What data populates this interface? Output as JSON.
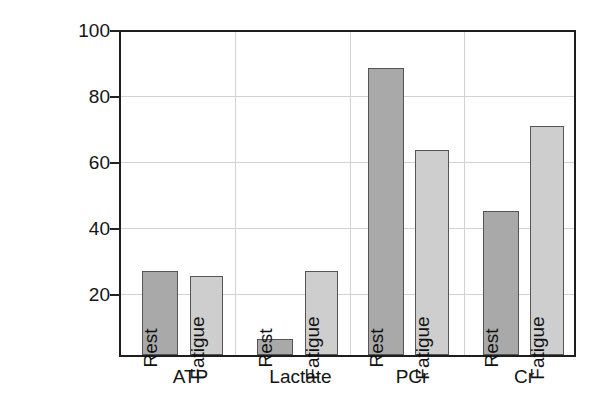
{
  "chart_data": {
    "type": "bar",
    "title": "",
    "xlabel": "",
    "ylabel": "mmoles/kg dry weight",
    "ylim": [
      0,
      100
    ],
    "yticks": [
      20,
      40,
      60,
      80,
      100
    ],
    "ytick_labels": [
      "20",
      "40",
      "60",
      "80",
      "100"
    ],
    "grid": true,
    "legend_position": "none",
    "categories": [
      "ATP",
      "Lactate",
      "PCr",
      "Cr"
    ],
    "series": [
      {
        "name": "Rest",
        "values": [
          26,
          5,
          89,
          44.5
        ]
      },
      {
        "name": "Fatigue",
        "values": [
          24.5,
          26,
          63.5,
          71
        ]
      }
    ],
    "bar_labels": [
      [
        "Rest",
        "Fatigue"
      ],
      [
        "Rest",
        "Fatigue"
      ],
      [
        "Rest",
        "Fatigue"
      ],
      [
        "Rest",
        "Fatigue"
      ]
    ],
    "colors": {
      "rest": "#a9a9a9",
      "fatigue": "#cecece",
      "bar_outline": "#555555",
      "axis": "#1e1e1e",
      "gridline": "#d2d2d2",
      "text": "#141414",
      "background": "#ffffff"
    }
  },
  "axis": {
    "y_title": "mmoles/kg dry weight",
    "y_tick_0": "100",
    "y_tick_1": "80",
    "y_tick_2": "60",
    "y_tick_3": "40",
    "y_tick_4": "20"
  },
  "categories": {
    "c0": "ATP",
    "c1": "Lactate",
    "c2": "PCr",
    "c3": "Cr"
  },
  "bars": {
    "atp_rest": "Rest",
    "atp_fatigue": "Fatigue",
    "lactate_rest": "Rest",
    "lactate_fatigue": "Fatigue",
    "pcr_rest": "Rest",
    "pcr_fatigue": "Fatigue",
    "cr_rest": "Rest",
    "cr_fatigue": "Fatigue"
  }
}
